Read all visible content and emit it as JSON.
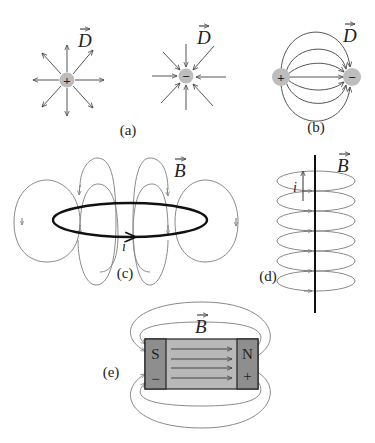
{
  "figure": {
    "panels": [
      {
        "id": "a",
        "label": "(a)",
        "vector": "D",
        "description": "Radial D-field lines: outward from positive charge, inward to negative charge",
        "charges": [
          {
            "sign": "+"
          },
          {
            "sign": "−"
          }
        ]
      },
      {
        "id": "b",
        "label": "(b)",
        "vector": "D",
        "description": "D-field lines from positive to negative charge (dipole)",
        "charges": [
          {
            "sign": "+"
          },
          {
            "sign": "−"
          }
        ]
      },
      {
        "id": "c",
        "label": "(c)",
        "vector": "B",
        "current": "i",
        "description": "Magnetic field loops around a current loop"
      },
      {
        "id": "d",
        "label": "(d)",
        "vector": "B",
        "current": "i",
        "description": "Magnetic field circles around a straight current-carrying wire"
      },
      {
        "id": "e",
        "label": "(e)",
        "vector": "B",
        "description": "Bar magnet with field lines",
        "poles": {
          "south": "S",
          "north": "N",
          "south_sign": "−",
          "north_sign": "+"
        }
      }
    ]
  },
  "colors": {
    "charge_fill": "#bdbdbd",
    "magnet_pole": "#8e8e8e",
    "magnet_body": "#b8b8b8",
    "field_line": "#555555"
  }
}
